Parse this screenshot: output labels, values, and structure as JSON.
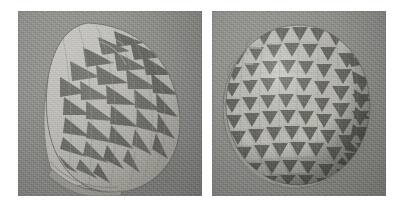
{
  "figure": {
    "kind": "photo-pair",
    "background_color": "#ffffff",
    "width": 403,
    "height": 205,
    "caption": "",
    "panels": [
      {
        "id": "left",
        "name": "panel-left",
        "x": 18,
        "y": 11,
        "width": 184,
        "height": 185,
        "subject": "layered folded-paper sculpture with nested petal leaves and curved dart spikes",
        "backdrop_color": "#8b8b89",
        "paper_light": "#b9b8b2",
        "paper_mid": "#a3a29c",
        "paper_shadow": "#7d7c78",
        "dart_color": "#6a6a66",
        "cast_shadow": "#757471"
      },
      {
        "id": "right",
        "name": "panel-right",
        "x": 212,
        "y": 11,
        "width": 174,
        "height": 185,
        "subject": "domed circular disc tessellated with alternating light and dark triangles",
        "backdrop_color": "#8b8b89",
        "paper_light": "#bcbbb5",
        "paper_mid": "#a5a49e",
        "paper_shadow": "#807f7b",
        "dart_color": "#696965",
        "cast_shadow": "#747370"
      }
    ]
  },
  "colors": {
    "page_background": "#ffffff",
    "backdrop_gray": "#8b8b89",
    "paper_highlight": "#c6c5bf",
    "paper_light": "#b9b8b2",
    "paper_mid": "#a3a29c",
    "paper_dark": "#8c8b86",
    "dart_dark": "#656561",
    "dart_darkest": "#575753",
    "shadow": "#6f6e6b"
  }
}
